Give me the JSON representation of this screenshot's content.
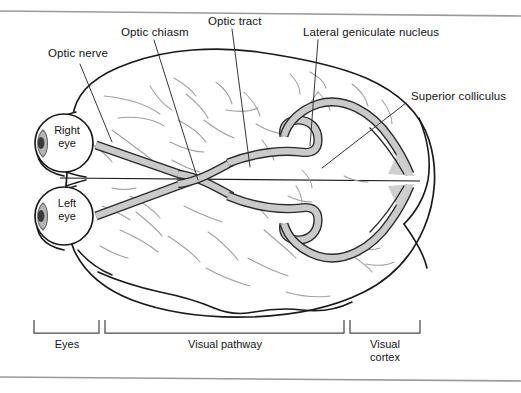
{
  "figure": {
    "type": "anatomical-diagram",
    "view": "inferior view of human brain with optic pathways",
    "background": "#ffffff",
    "frame": {
      "top_rule": true,
      "bottom_rule": true,
      "rule_color": "#9a9a9a"
    },
    "colors": {
      "outline": "#1a1a1a",
      "sulci": "#9b9b9b",
      "tract_fill": "#c9c9c9",
      "tract_stroke": "#2a2a2a",
      "eye_outline": "#1a1a1a",
      "lens_fill": "#b5b5b5",
      "pupil_fill": "#3a3a3a",
      "leader_line": "#2c2c2c",
      "bracket": "#4a4a4a",
      "text": "#141414"
    }
  },
  "callouts": [
    {
      "id": "optic-nerve",
      "label": "Optic nerve"
    },
    {
      "id": "optic-chiasm",
      "label": "Optic chiasm"
    },
    {
      "id": "optic-tract",
      "label": "Optic tract"
    },
    {
      "id": "lateral-geniculate-nucleus",
      "label": "Lateral geniculate nucleus"
    },
    {
      "id": "superior-colliculus",
      "label": "Superior colliculus"
    }
  ],
  "eyes": [
    {
      "id": "right-eye",
      "line1": "Right",
      "line2": "eye"
    },
    {
      "id": "left-eye",
      "line1": "Left",
      "line2": "eye"
    }
  ],
  "brackets": [
    {
      "id": "eyes",
      "line1": "Eyes",
      "line2": ""
    },
    {
      "id": "visual-pathway",
      "line1": "Visual pathway",
      "line2": ""
    },
    {
      "id": "visual-cortex",
      "line1": "Visual",
      "line2": "cortex"
    }
  ]
}
